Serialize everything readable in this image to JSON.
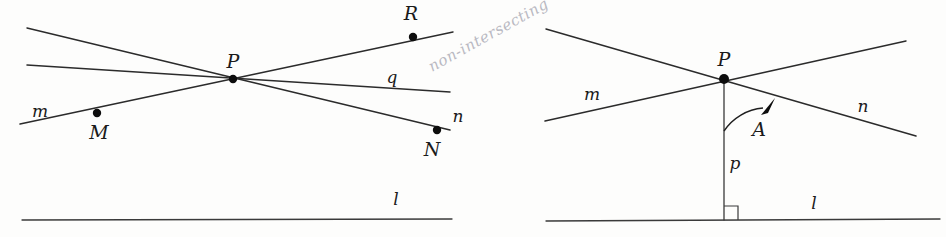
{
  "figure": {
    "background_color": "#fdfdfc",
    "ink_color": "#2b2b2b",
    "annotation_color": "#b9b9c2",
    "handwritten_note": "non-intersecting"
  },
  "left_panel": {
    "name": "non-intersecting-lines-through-point",
    "labels": {
      "point_p": "P",
      "point_m": "M",
      "point_n": "N",
      "point_r": "R",
      "line_m": "m",
      "line_q": "q",
      "line_n": "n",
      "line_l": "l"
    },
    "points": [
      {
        "id": "P",
        "label": "P",
        "x": 233,
        "y": 79,
        "label_x": 233,
        "label_y": 68,
        "dot": true
      },
      {
        "id": "M",
        "label": "M",
        "x": 97,
        "y": 113,
        "label_x": 99,
        "label_y": 139,
        "dot": true
      },
      {
        "id": "R",
        "label": "R",
        "x": 413,
        "y": 37,
        "label_x": 411,
        "label_y": 20,
        "dot": true
      },
      {
        "id": "N",
        "label": "N",
        "x": 437,
        "y": 130,
        "label_x": 432,
        "label_y": 156,
        "dot": true
      }
    ],
    "lines": [
      {
        "id": "line-upper",
        "x1": 27,
        "y1": 28,
        "x2": 450,
        "y2": 130
      },
      {
        "id": "line-q",
        "x1": 27,
        "y1": 65,
        "x2": 450,
        "y2": 92
      },
      {
        "id": "line-m-r",
        "x1": 20,
        "y1": 124,
        "x2": 453,
        "y2": 32
      },
      {
        "id": "line-l",
        "x1": 22,
        "y1": 220,
        "x2": 452,
        "y2": 219
      }
    ],
    "line_labels": [
      {
        "id": "m",
        "text": "m",
        "x": 40,
        "y": 117
      },
      {
        "id": "q",
        "text": "q",
        "x": 392,
        "y": 83
      },
      {
        "id": "n",
        "text": "n",
        "x": 458,
        "y": 122
      },
      {
        "id": "l",
        "text": "l",
        "x": 396,
        "y": 205
      }
    ]
  },
  "right_panel": {
    "name": "angle-of-parallelism",
    "labels": {
      "point_p": "P",
      "angle_a": "A",
      "line_m": "m",
      "line_n": "n",
      "line_p": "p",
      "line_l": "l"
    },
    "points": [
      {
        "id": "P",
        "label": "P",
        "x": 724,
        "y": 79,
        "label_x": 724,
        "label_y": 66,
        "dot": true
      }
    ],
    "lines": [
      {
        "id": "line-m",
        "x1": 545,
        "y1": 121,
        "x2": 906,
        "y2": 41
      },
      {
        "id": "line-n",
        "x1": 546,
        "y1": 29,
        "x2": 916,
        "y2": 136
      },
      {
        "id": "line-p-perp",
        "x1": 724,
        "y1": 79,
        "x2": 724,
        "y2": 220
      },
      {
        "id": "line-l",
        "x1": 546,
        "y1": 221,
        "x2": 940,
        "y2": 219
      }
    ],
    "line_labels": [
      {
        "id": "m",
        "text": "m",
        "x": 592,
        "y": 100
      },
      {
        "id": "n",
        "text": "n",
        "x": 863,
        "y": 112
      },
      {
        "id": "p",
        "text": "p",
        "x": 735,
        "y": 169
      },
      {
        "id": "l",
        "text": "l",
        "x": 814,
        "y": 209
      },
      {
        "id": "A",
        "text": "A",
        "x": 759,
        "y": 136
      }
    ],
    "angle_arc": {
      "id": "angle-arc-A",
      "center_x": 724,
      "center_y": 79,
      "radius": 52,
      "from": "vertical-line-p",
      "to": "line-n",
      "has_arrowhead": true
    },
    "right_angle_marker": {
      "id": "right-angle-square",
      "x": 724,
      "y": 220,
      "size": 14
    }
  }
}
